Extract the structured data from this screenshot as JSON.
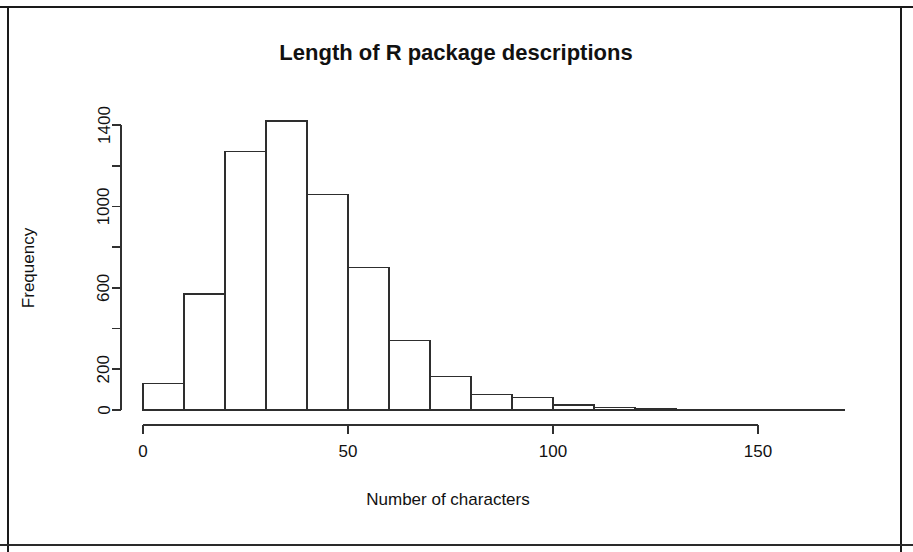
{
  "figure": {
    "title": "Length of R package descriptions",
    "xlabel": "Number of characters",
    "ylabel": "Frequency"
  },
  "chart_data": {
    "type": "bar",
    "title": "Length of R package descriptions",
    "subtitle": "",
    "xlabel": "Number of characters",
    "ylabel": "Frequency",
    "xlim": [
      0,
      165
    ],
    "ylim": [
      0,
      1460
    ],
    "grid": false,
    "legend": null,
    "bin_width": 10,
    "bin_edges": [
      0,
      10,
      20,
      30,
      40,
      50,
      60,
      70,
      80,
      90,
      100,
      110,
      120,
      130,
      140,
      150,
      160
    ],
    "categories": [
      "0-10",
      "10-20",
      "20-30",
      "30-40",
      "40-50",
      "50-60",
      "60-70",
      "70-80",
      "80-90",
      "90-100",
      "100-110",
      "110-120",
      "120-130",
      "130-140",
      "140-150",
      "150-160"
    ],
    "values": [
      130,
      570,
      1270,
      1420,
      1060,
      700,
      340,
      165,
      75,
      60,
      25,
      12,
      5,
      3,
      2,
      1
    ],
    "x_ticks": [
      0,
      50,
      100,
      150
    ],
    "x_tick_labels": [
      "0",
      "50",
      "100",
      "150"
    ],
    "y_ticks": [
      0,
      200,
      400,
      600,
      800,
      1000,
      1200,
      1400
    ],
    "y_tick_labels": [
      "0",
      "200",
      "",
      "600",
      "",
      "1000",
      "",
      "1400"
    ],
    "y_labeled_ticks": [
      0,
      200,
      600,
      1000,
      1400
    ],
    "bar_fill": "#ffffff",
    "bar_stroke": "#2e2e2e",
    "axis_color": "#303030"
  }
}
